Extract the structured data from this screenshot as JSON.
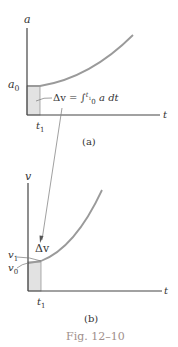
{
  "figure": {
    "caption": "Fig. 12–10",
    "caption_color": "#a08f8b",
    "panel_a": {
      "label": "(a)",
      "y_axis_label": "a",
      "x_axis_label": "t",
      "y_intercept_label": "a",
      "y_intercept_sub": "0",
      "t1_label": "t",
      "t1_sub": "1",
      "area_label": "Δv = ∫",
      "integral_lower": "0",
      "integral_upper": "t",
      "integral_upper_sub": "1",
      "integrand": "a dt"
    },
    "panel_b": {
      "label": "(b)",
      "y_axis_label": "v",
      "x_axis_label": "t",
      "v1_label": "v",
      "v1_sub": "1",
      "v0_label": "v",
      "v0_sub": "0",
      "delta_label": "Δv",
      "t1_label": "t",
      "t1_sub": "1"
    },
    "colors": {
      "axis": "#444444",
      "curve": "#999999",
      "shade": "#e0e0e0",
      "shade_border": "#888888",
      "text": "#333333"
    }
  }
}
